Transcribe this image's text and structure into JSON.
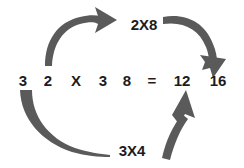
{
  "canvas": {
    "width": 244,
    "height": 168,
    "background": "#ffffff"
  },
  "colors": {
    "arrow": "#5a5a5a",
    "text": "#1c1c1c",
    "background": "#ffffff"
  },
  "equation": {
    "terms": [
      {
        "text": "3",
        "x": 15,
        "width": 16
      },
      {
        "text": "2",
        "x": 40,
        "width": 16
      },
      {
        "text": "X",
        "x": 68,
        "width": 16
      },
      {
        "text": "3",
        "x": 95,
        "width": 16
      },
      {
        "text": "8",
        "x": 119,
        "width": 16
      },
      {
        "text": "=",
        "x": 144,
        "width": 16
      },
      {
        "text": "12",
        "x": 172,
        "width": 20
      },
      {
        "text": "16",
        "x": 208,
        "width": 20
      }
    ]
  },
  "labels": {
    "top": "2X8",
    "bottom": "3X4"
  },
  "arrows": [
    {
      "name": "arrow-inner-two-to-eight",
      "from": "2",
      "to": "2X8",
      "direction": "right",
      "style": "curved-tapered-with-head"
    },
    {
      "name": "arrow-outer-eight-to-sixteen",
      "from": "2X8",
      "to": "16",
      "direction": "down",
      "style": "curved-tapered-with-head"
    },
    {
      "name": "arrow-outer-three-to-three-times-four",
      "from": "3",
      "to": "3X4",
      "direction": "right",
      "style": "curved-tapered-tail"
    },
    {
      "name": "arrow-inner-three-times-four-to-twelve",
      "from": "3X4",
      "to": "12",
      "direction": "up",
      "style": "tapered-with-head"
    }
  ]
}
